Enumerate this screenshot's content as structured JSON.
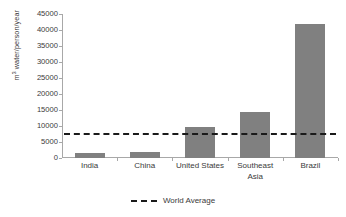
{
  "chart_data": {
    "type": "bar",
    "title": "",
    "subtitle": "",
    "xlabel": "",
    "ylabel": "m³ water/person/year",
    "ylabel_prefix": "m",
    "ylabel_superscript": "3",
    "ylabel_suffix": " water/person/year",
    "categories": [
      "India",
      "China",
      "United States",
      "Southeast Asia",
      "Brazil"
    ],
    "category_lines": [
      [
        "India"
      ],
      [
        "China"
      ],
      [
        "United States"
      ],
      [
        "Southeast",
        "Asia"
      ],
      [
        "Brazil"
      ]
    ],
    "values": [
      1600,
      2000,
      9700,
      14500,
      42000
    ],
    "series": [
      {
        "name": "Water availability",
        "values": [
          1600,
          2000,
          9700,
          14500,
          42000
        ],
        "color": "#808080",
        "type": "bar"
      },
      {
        "name": "World Average",
        "value": 7800,
        "color": "#1a1a1a",
        "type": "reference-line",
        "style": "dashed"
      }
    ],
    "ylim": [
      0,
      45000
    ],
    "ytick_values": [
      0,
      5000,
      10000,
      15000,
      20000,
      25000,
      30000,
      35000,
      40000,
      45000
    ],
    "ytick_labels": [
      "0",
      "5000",
      "10000",
      "15000",
      "20000",
      "25000",
      "30000",
      "35000",
      "40000",
      "45000"
    ],
    "grid": false,
    "legend_position": "bottom-center",
    "legend": [
      {
        "label": "World Average",
        "style": "dashed",
        "color": "#1a1a1a"
      }
    ],
    "bar_color": "#808080",
    "axis_color": "#a8a8a8",
    "background": "#ffffff"
  }
}
